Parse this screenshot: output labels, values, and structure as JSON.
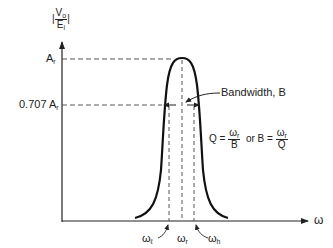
{
  "diagram": {
    "type": "resonance-curve",
    "y_axis_label": {
      "abs_open": "|",
      "num": "V",
      "num_sub": "o",
      "den": "E",
      "den_sub": "i",
      "abs_close": "|"
    },
    "x_axis_label": "ω",
    "y_ticks": [
      {
        "text": "A",
        "sub": "r"
      },
      {
        "text": "0.707 A",
        "sub": "r"
      }
    ],
    "x_ticks": [
      {
        "text": "ω",
        "sub": "ℓ"
      },
      {
        "text": "ω",
        "sub": "r"
      },
      {
        "text": "ω",
        "sub": "h"
      }
    ],
    "bandwidth_label": "Bandwidth, B",
    "formula": {
      "q_lhs": "Q =",
      "q_num": "ω",
      "q_num_sub": "r",
      "q_den": "B",
      "or": "or",
      "b_lhs": "B =",
      "b_num": "ω",
      "b_num_sub": "r",
      "b_den": "Q"
    },
    "colors": {
      "ink": "#222222",
      "background": "#ffffff"
    }
  }
}
